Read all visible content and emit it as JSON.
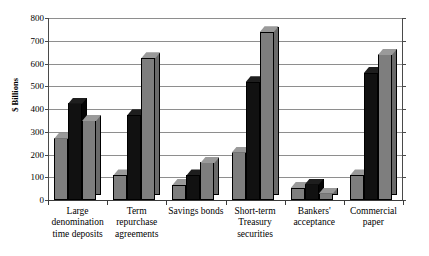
{
  "chart_data": {
    "type": "bar",
    "title": "",
    "subtitle": "",
    "xlabel": "",
    "ylabel": "$ Billions",
    "ylim": [
      0,
      800
    ],
    "yticks": [
      0,
      100,
      200,
      300,
      400,
      500,
      600,
      700,
      800
    ],
    "ytick_labels": [
      "0",
      "100",
      "200",
      "300",
      "400",
      "500",
      "600",
      "700",
      "800"
    ],
    "grid": true,
    "legend": "none",
    "style": "3d-bar",
    "bars_per_group": 3,
    "series_colors": [
      "#7e7e7e",
      "#111111",
      "#7e7e7e"
    ],
    "categories": [
      "Large\ndenomination\ntime deposits",
      "Term\nrepurchase\nagreements",
      "Savings bonds",
      "Short-term\nTreasury\nsecurities",
      "Bankers'\nacceptance",
      "Commercial\npaper"
    ],
    "series": [
      {
        "name": "Series 1",
        "color": "#7e7e7e",
        "values": [
          272,
          110,
          68,
          210,
          55,
          110
        ]
      },
      {
        "name": "Series 2",
        "color": "#111111",
        "values": [
          425,
          375,
          110,
          520,
          70,
          560
        ]
      },
      {
        "name": "Series 3",
        "color": "#7e7e7e",
        "values": [
          350,
          625,
          165,
          740,
          30,
          640
        ]
      }
    ]
  }
}
